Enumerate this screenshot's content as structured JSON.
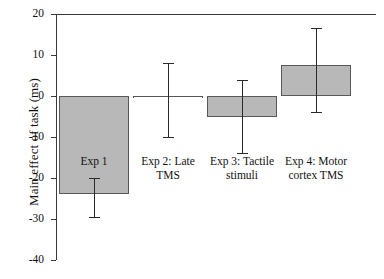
{
  "chart_data": {
    "type": "bar",
    "title": "",
    "xlabel": "",
    "ylabel": "Main effect of task (ms)",
    "ylim": [
      -40,
      20
    ],
    "yticks": [
      20,
      10,
      0,
      -10,
      -20,
      -30,
      -40
    ],
    "ytick_labels": [
      "20",
      "10",
      "0",
      "-10",
      "-20",
      "-30",
      "-40"
    ],
    "grid": false,
    "legend": "none",
    "orientation": "vertical",
    "error_bar_style": "capped-vertical",
    "categories": [
      "Exp 1",
      "Exp 2: Late\nTMS",
      "Exp 3: Tactile\nstimuli",
      "Exp 4: Motor\ncortex TMS"
    ],
    "values": [
      -24.0,
      -0.5,
      -5.0,
      7.5
    ],
    "err_high": [
      -20.0,
      8.0,
      4.0,
      16.5
    ],
    "err_low": [
      -29.5,
      -10.0,
      -14.0,
      -4.0
    ],
    "bars": [
      {
        "label": "Exp 1",
        "label_lines": [
          "Exp 1"
        ],
        "label_inside_bar": true,
        "value": -24.0,
        "err_high": -20.0,
        "err_low": -29.5
      },
      {
        "label": "Exp 2: Late TMS",
        "label_lines": [
          "Exp 2: Late",
          "TMS"
        ],
        "label_inside_bar": false,
        "value": -0.5,
        "err_high": 8.0,
        "err_low": -10.0
      },
      {
        "label": "Exp 3: Tactile stimuli",
        "label_lines": [
          "Exp 3: Tactile",
          "stimuli"
        ],
        "label_inside_bar": false,
        "value": -5.0,
        "err_high": 4.0,
        "err_low": -14.0
      },
      {
        "label": "Exp 4: Motor cortex TMS",
        "label_lines": [
          "Exp 4: Motor",
          "cortex TMS"
        ],
        "label_inside_bar": false,
        "value": 7.5,
        "err_high": 16.5,
        "err_low": -4.0
      }
    ],
    "colors": {
      "bar_fill": "#b8b8b8",
      "bar_edge": "#585858",
      "axis": "#3a3a3a",
      "error_bar": "#2a2a2a",
      "text": "#111111",
      "background": "#ffffff"
    }
  }
}
